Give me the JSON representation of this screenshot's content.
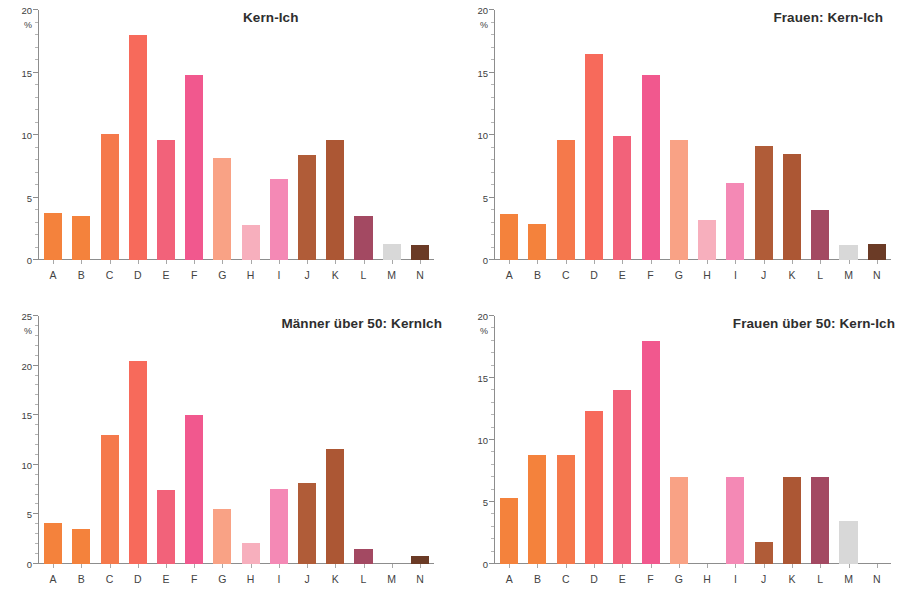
{
  "figure": {
    "axis_unit_label": "%",
    "categories": [
      "A",
      "B",
      "C",
      "D",
      "E",
      "F",
      "G",
      "H",
      "I",
      "J",
      "K",
      "L",
      "M",
      "N"
    ],
    "bar_colors": [
      "#F4823C",
      "#F4823C",
      "#F5794B",
      "#F76A5B",
      "#F2627A",
      "#F1588E",
      "#F9A285",
      "#F7AFBD",
      "#F489B5",
      "#B05C38",
      "#AC5734",
      "#A34962",
      "#D8D8D8",
      "#6B3B26"
    ]
  },
  "charts": [
    {
      "panel": "top-left",
      "chart_data": {
        "type": "bar",
        "title": "Kern-Ich",
        "xlabel": "",
        "ylabel": "%",
        "ylim": [
          0,
          20
        ],
        "yticks": [
          0,
          5,
          10,
          15,
          20
        ],
        "grid": false,
        "legend": "none",
        "categories": [
          "A",
          "B",
          "C",
          "D",
          "E",
          "F",
          "G",
          "H",
          "I",
          "J",
          "K",
          "L",
          "M",
          "N"
        ],
        "values": [
          3.8,
          3.5,
          10.1,
          18.0,
          9.6,
          14.8,
          8.2,
          2.8,
          6.5,
          8.4,
          9.6,
          3.5,
          1.3,
          1.2
        ]
      }
    },
    {
      "panel": "top-right",
      "chart_data": {
        "type": "bar",
        "title": "Frauen: Kern-Ich",
        "xlabel": "",
        "ylabel": "%",
        "ylim": [
          0,
          20
        ],
        "yticks": [
          0,
          5,
          10,
          15,
          20
        ],
        "grid": false,
        "legend": "none",
        "categories": [
          "A",
          "B",
          "C",
          "D",
          "E",
          "F",
          "G",
          "H",
          "I",
          "J",
          "K",
          "L",
          "M",
          "N"
        ],
        "values": [
          3.7,
          2.9,
          9.6,
          16.5,
          9.9,
          14.8,
          9.6,
          3.2,
          6.2,
          9.1,
          8.5,
          4.0,
          1.2,
          1.3
        ]
      }
    },
    {
      "panel": "bottom-left",
      "chart_data": {
        "type": "bar",
        "title": "Männer über 50: KernIch",
        "xlabel": "",
        "ylabel": "%",
        "ylim": [
          0,
          25
        ],
        "yticks": [
          0,
          5,
          10,
          15,
          20,
          25
        ],
        "grid": false,
        "legend": "none",
        "categories": [
          "A",
          "B",
          "C",
          "D",
          "E",
          "F",
          "G",
          "H",
          "I",
          "J",
          "K",
          "L",
          "M",
          "N"
        ],
        "values": [
          4.1,
          3.5,
          13.0,
          20.5,
          7.5,
          15.0,
          5.5,
          2.1,
          7.6,
          8.2,
          11.6,
          1.5,
          0.0,
          0.8
        ]
      }
    },
    {
      "panel": "bottom-right",
      "chart_data": {
        "type": "bar",
        "title": "Frauen über 50: Kern-Ich",
        "xlabel": "",
        "ylabel": "%",
        "ylim": [
          0,
          20
        ],
        "yticks": [
          0,
          5,
          10,
          15,
          20
        ],
        "grid": false,
        "legend": "none",
        "categories": [
          "A",
          "B",
          "C",
          "D",
          "E",
          "F",
          "G",
          "H",
          "I",
          "J",
          "K",
          "L",
          "M",
          "N"
        ],
        "values": [
          5.3,
          8.8,
          8.8,
          12.3,
          14.0,
          18.0,
          7.0,
          0.0,
          7.0,
          1.8,
          7.0,
          7.0,
          3.5,
          0.0
        ]
      }
    }
  ]
}
